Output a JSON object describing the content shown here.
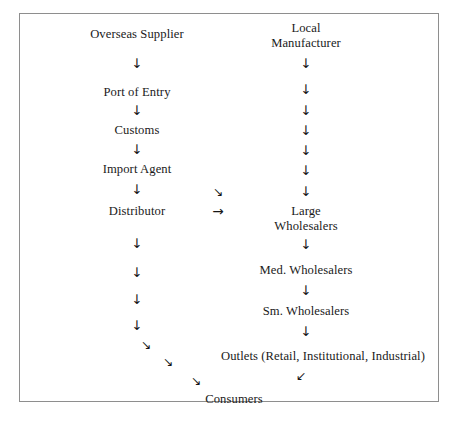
{
  "diagram": {
    "frame": {
      "border_color": "#8e8e8e",
      "background": "#ffffff"
    },
    "columns": {
      "left": {
        "name": "import-chain",
        "center_x": 136
      },
      "middle": {
        "name": "transfer-arrows",
        "center_x": 217
      },
      "right": {
        "name": "local-chain",
        "center_x": 305
      }
    },
    "nodes": [
      {
        "id": "overseas-supplier",
        "label": "Overseas Supplier",
        "column": "left",
        "x": 136,
        "y": 26
      },
      {
        "id": "port-of-entry",
        "label": "Port of Entry",
        "column": "left",
        "x": 136,
        "y": 84
      },
      {
        "id": "customs",
        "label": "Customs",
        "column": "left",
        "x": 136,
        "y": 122
      },
      {
        "id": "import-agent",
        "label": "Import Agent",
        "column": "left",
        "x": 136,
        "y": 161
      },
      {
        "id": "distributor",
        "label": "Distributor",
        "column": "left",
        "x": 136,
        "y": 203
      },
      {
        "id": "local-manufacturer",
        "label": "Local\nManufacturer",
        "line1": "Local",
        "line2": "Manufacturer",
        "column": "right",
        "x": 305,
        "y": 20
      },
      {
        "id": "large-wholesalers",
        "label": "Large\nWholesalers",
        "line1": "Large",
        "line2": "Wholesalers",
        "column": "right",
        "x": 305,
        "y": 203
      },
      {
        "id": "med-wholesalers",
        "label": "Med. Wholesalers",
        "column": "right",
        "x": 305,
        "y": 262
      },
      {
        "id": "sm-wholesalers",
        "label": "Sm. Wholesalers",
        "column": "right",
        "x": 305,
        "y": 303
      },
      {
        "id": "outlets",
        "label": "Outlets (Retail, Institutional, Industrial)",
        "column": "right",
        "x": 322,
        "y": 348
      },
      {
        "id": "consumers",
        "label": "Consumers",
        "column": "center",
        "x": 233,
        "y": 391
      }
    ],
    "arrows": [
      {
        "id": "left-arrow-1",
        "glyph": "↓",
        "kind": "down",
        "x": 136,
        "y": 56
      },
      {
        "id": "left-arrow-2",
        "glyph": "↓",
        "kind": "down",
        "x": 136,
        "y": 103
      },
      {
        "id": "left-arrow-3",
        "glyph": "↓",
        "kind": "down",
        "x": 136,
        "y": 142
      },
      {
        "id": "left-arrow-4",
        "glyph": "↓",
        "kind": "down",
        "x": 136,
        "y": 182
      },
      {
        "id": "left-arrow-5",
        "glyph": "↓",
        "kind": "down",
        "x": 136,
        "y": 236
      },
      {
        "id": "left-arrow-6",
        "glyph": "↓",
        "kind": "down",
        "x": 136,
        "y": 265
      },
      {
        "id": "left-arrow-7",
        "glyph": "↓",
        "kind": "down",
        "x": 136,
        "y": 292
      },
      {
        "id": "left-arrow-8",
        "glyph": "↓",
        "kind": "down",
        "x": 136,
        "y": 318
      },
      {
        "id": "left-arrow-9",
        "glyph": "↘",
        "kind": "down-right",
        "x": 145,
        "y": 337
      },
      {
        "id": "left-arrow-10",
        "glyph": "↘",
        "kind": "down-right",
        "x": 167,
        "y": 354
      },
      {
        "id": "left-arrow-11",
        "glyph": "↘",
        "kind": "down-right",
        "x": 195,
        "y": 373
      },
      {
        "id": "mid-arrow-diag",
        "glyph": "↘",
        "kind": "down-right",
        "x": 217,
        "y": 184
      },
      {
        "id": "mid-arrow-right",
        "glyph": "→",
        "kind": "right",
        "x": 217,
        "y": 204
      },
      {
        "id": "right-arrow-1",
        "glyph": "↓",
        "kind": "down",
        "x": 305,
        "y": 56
      },
      {
        "id": "right-arrow-2",
        "glyph": "↓",
        "kind": "down",
        "x": 305,
        "y": 82
      },
      {
        "id": "right-arrow-3",
        "glyph": "↓",
        "kind": "down",
        "x": 305,
        "y": 103
      },
      {
        "id": "right-arrow-4",
        "glyph": "↓",
        "kind": "down",
        "x": 305,
        "y": 123
      },
      {
        "id": "right-arrow-5",
        "glyph": "↓",
        "kind": "down",
        "x": 305,
        "y": 143
      },
      {
        "id": "right-arrow-6",
        "glyph": "↓",
        "kind": "down",
        "x": 305,
        "y": 163
      },
      {
        "id": "right-arrow-7",
        "glyph": "↓",
        "kind": "down",
        "x": 305,
        "y": 184
      },
      {
        "id": "right-arrow-8",
        "glyph": "↓",
        "kind": "down",
        "x": 305,
        "y": 237
      },
      {
        "id": "right-arrow-9",
        "glyph": "↓",
        "kind": "down",
        "x": 305,
        "y": 283
      },
      {
        "id": "right-arrow-10",
        "glyph": "↓",
        "kind": "down",
        "x": 305,
        "y": 324
      },
      {
        "id": "outlets-to-consumers",
        "glyph": "↙",
        "kind": "down-left",
        "x": 300,
        "y": 368
      }
    ]
  }
}
